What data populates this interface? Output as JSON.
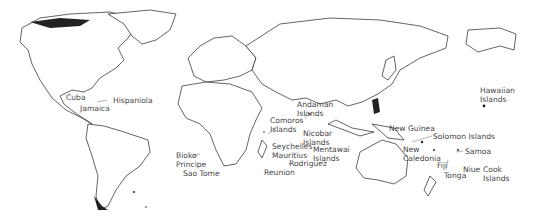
{
  "map": {
    "title": "World map of island regions",
    "labels": [
      {
        "id": "cuba",
        "text": "Cuba",
        "x": 66,
        "y": 94
      },
      {
        "id": "jamaica",
        "text": "Jamaica",
        "x": 80,
        "y": 106
      },
      {
        "id": "hispaniola",
        "text": "Hispaniola",
        "x": 113,
        "y": 98
      },
      {
        "id": "bioko",
        "text": "Bioko",
        "x": 176,
        "y": 152
      },
      {
        "id": "principe",
        "text": "Principe",
        "x": 176,
        "y": 161
      },
      {
        "id": "sao-tome",
        "text": "Sao Tome",
        "x": 183,
        "y": 170
      },
      {
        "id": "comoros",
        "text": "Comoros",
        "x": 270,
        "y": 117
      },
      {
        "id": "comoros-2",
        "text": "Islands",
        "x": 270,
        "y": 126
      },
      {
        "id": "andaman",
        "text": "Andaman",
        "x": 297,
        "y": 101
      },
      {
        "id": "andaman-2",
        "text": "Islands",
        "x": 297,
        "y": 110
      },
      {
        "id": "nicobar",
        "text": "Nicobar",
        "x": 303,
        "y": 130
      },
      {
        "id": "nicobar-2",
        "text": "Islands",
        "x": 303,
        "y": 139
      },
      {
        "id": "seychelles",
        "text": "Seychelles",
        "x": 272,
        "y": 143
      },
      {
        "id": "mauritius",
        "text": "Mauritius",
        "x": 272,
        "y": 152
      },
      {
        "id": "mentawai",
        "text": "Mentawai",
        "x": 313,
        "y": 146
      },
      {
        "id": "mentawai-2",
        "text": "Islands",
        "x": 313,
        "y": 155
      },
      {
        "id": "rodriguez",
        "text": "Rodriguez",
        "x": 289,
        "y": 160
      },
      {
        "id": "reunion",
        "text": "Reunion",
        "x": 264,
        "y": 169
      },
      {
        "id": "new-guinea",
        "text": "New Guinea",
        "x": 389,
        "y": 125
      },
      {
        "id": "solomon",
        "text": "Solomon Islands",
        "x": 433,
        "y": 133
      },
      {
        "id": "new-caledonia",
        "text": "New",
        "x": 403,
        "y": 146
      },
      {
        "id": "new-caledonia-2",
        "text": "Caledonia",
        "x": 403,
        "y": 155
      },
      {
        "id": "samoa",
        "text": "Samoa",
        "x": 465,
        "y": 148
      },
      {
        "id": "fiji",
        "text": "Fiji",
        "x": 437,
        "y": 162
      },
      {
        "id": "niue",
        "text": "Niue",
        "x": 463,
        "y": 166
      },
      {
        "id": "tonga",
        "text": "Tonga",
        "x": 444,
        "y": 172
      },
      {
        "id": "cook",
        "text": "Cook",
        "x": 483,
        "y": 166
      },
      {
        "id": "cook-2",
        "text": "Islands",
        "x": 483,
        "y": 175
      },
      {
        "id": "hawaiian",
        "text": "Hawaiian",
        "x": 480,
        "y": 87
      },
      {
        "id": "hawaiian-2",
        "text": "Islands",
        "x": 480,
        "y": 96
      }
    ]
  }
}
